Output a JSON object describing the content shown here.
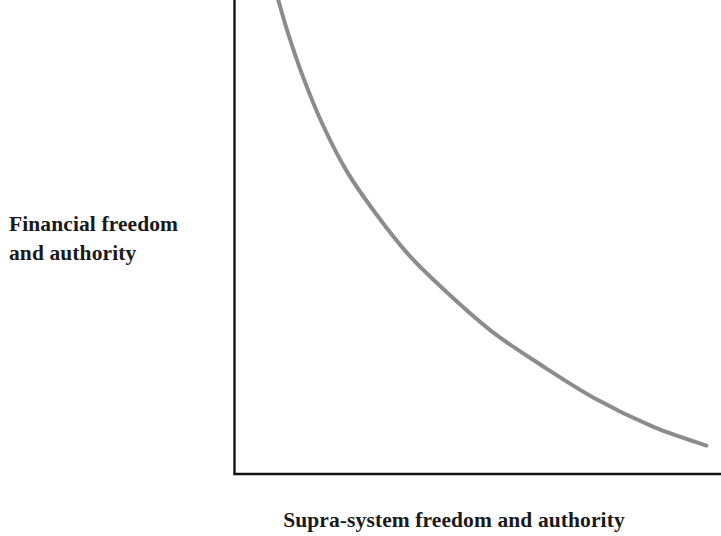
{
  "chart_data": {
    "type": "line",
    "title": "",
    "subtitle": "",
    "xlabel": "Supra-system freedom and authority",
    "ylabel": "Financial freedom\nand authority",
    "ylabel_line1": "Financial freedom",
    "ylabel_line2": "and authority",
    "grid": false,
    "legend": false,
    "legend_position": "none",
    "xlim": [
      0,
      1
    ],
    "ylim": [
      0,
      1
    ],
    "x_tick_labels": [],
    "y_tick_labels": [],
    "annotations": [],
    "series": [
      {
        "name": "Trade-off curve",
        "color": "#8c8c8c",
        "line_width": 4,
        "description": "Monotonically decreasing convex hyperbolic trade-off curve",
        "x": [
          0.09,
          0.11,
          0.14,
          0.18,
          0.23,
          0.29,
          0.36,
          0.44,
          0.53,
          0.63,
          0.74,
          0.86,
          0.97
        ],
        "y": [
          1.0,
          0.93,
          0.84,
          0.74,
          0.64,
          0.55,
          0.46,
          0.38,
          0.3,
          0.23,
          0.16,
          0.1,
          0.06
        ]
      }
    ]
  },
  "figure": {
    "background_color": "#ffffff",
    "axis_color": "#111111",
    "curve_color": "#8c8c8c",
    "axis_line_width": 2.4
  }
}
